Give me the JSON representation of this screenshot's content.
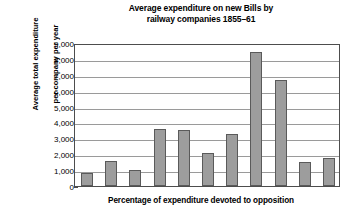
{
  "chart_data": {
    "type": "bar",
    "title": "Average expenditure on new Bills by railway companies 1855–61",
    "title_line1": "Average expenditure on new Bills by",
    "title_line2": "railway companies 1855–61",
    "xlabel": "Percentage of expenditure devoted to opposition",
    "ylabel": "Average total expenditure per company per year",
    "ylabel_line1": "Average total expenditure",
    "ylabel_line2": "per company per year",
    "ylim": [
      0,
      9000
    ],
    "ytick_step": 1000,
    "ytick_labels": [
      "9,000",
      "8,000",
      "7,000",
      "6,000",
      "5,000",
      "4,000",
      "3,000",
      "2,000",
      "1,000",
      "0"
    ],
    "ytick_values": [
      9000,
      8000,
      7000,
      6000,
      5000,
      4000,
      3000,
      2000,
      1000,
      0
    ],
    "grid": true,
    "legend": "none",
    "categories": [
      "",
      "",
      "",
      "",
      "",
      "",
      "",
      "",
      "",
      "",
      ""
    ],
    "values": [
      800,
      1600,
      1000,
      3600,
      3550,
      2050,
      3300,
      8450,
      6650,
      1500,
      1750
    ],
    "bar_color": "#9d9d9d",
    "bar_border_color": "#5a5a5a",
    "grid_color": "#9a9a9a",
    "axis_color": "#4d4d4d",
    "background": "#ffffff"
  }
}
